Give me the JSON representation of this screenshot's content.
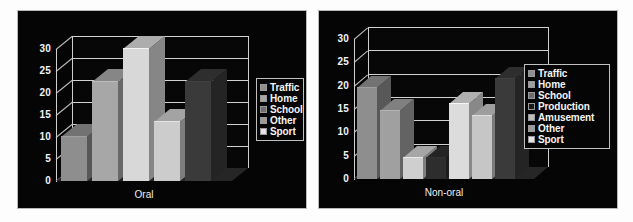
{
  "figure": {
    "background": "#ffffff",
    "panel_background": "#050505",
    "panel_border": "#b9b9b9"
  },
  "chart_data": [
    {
      "id": "oral",
      "type": "bar",
      "title": "",
      "xlabel": "Oral",
      "ylabel": "",
      "categories": [
        "Oral"
      ],
      "ylim": [
        0,
        30
      ],
      "yticks": [
        0,
        5,
        10,
        15,
        20,
        25,
        30
      ],
      "ytick_labels": [
        "0",
        "5",
        "10",
        "15",
        "20",
        "25",
        "30"
      ],
      "grid": true,
      "legend_position": "right",
      "three_d": true,
      "series": [
        {
          "name": "Traffic",
          "value": 10.0,
          "color": "#8e8e8e"
        },
        {
          "name": "Home",
          "value": 22.5,
          "color": "#a7a7a7"
        },
        {
          "name": "School",
          "value": 30.0,
          "color": "#d8d8d8"
        },
        {
          "name": "Other",
          "value": 13.5,
          "color": "#cccccc"
        },
        {
          "name": "Sport",
          "value": 22.5,
          "color": "#3a3a3a"
        }
      ],
      "legend": [
        {
          "label": "Traffic",
          "color": "#8e8e8e"
        },
        {
          "label": "Home",
          "color": "#a7a7a7"
        },
        {
          "label": "School",
          "color": "#6e6e6e"
        },
        {
          "label": "Other",
          "color": "#9b9b9b"
        },
        {
          "label": "Sport",
          "color": "#e3e3e3"
        }
      ]
    },
    {
      "id": "non-oral",
      "type": "bar",
      "title": "",
      "xlabel": "Non-oral",
      "ylabel": "",
      "categories": [
        "Non-oral"
      ],
      "ylim": [
        0,
        30
      ],
      "yticks": [
        0,
        5,
        10,
        15,
        20,
        25,
        30
      ],
      "ytick_labels": [
        "0",
        "5",
        "10",
        "15",
        "20",
        "25",
        "30"
      ],
      "grid": true,
      "legend_position": "right",
      "three_d": true,
      "series": [
        {
          "name": "Traffic",
          "value": 19.5,
          "color": "#8e8e8e"
        },
        {
          "name": "Home",
          "value": 14.5,
          "color": "#a0a0a0"
        },
        {
          "name": "School",
          "value": 4.5,
          "color": "#cfcfcf"
        },
        {
          "name": "Production",
          "value": 4.5,
          "color": "#2d2d2d"
        },
        {
          "name": "Amusement",
          "value": 16.0,
          "color": "#dcdcdc"
        },
        {
          "name": "Other",
          "value": 13.5,
          "color": "#c6c6c6"
        },
        {
          "name": "Sport",
          "value": 21.5,
          "color": "#3a3a3a"
        }
      ],
      "legend": [
        {
          "label": "Traffic",
          "color": "#8e8e8e"
        },
        {
          "label": "Home",
          "color": "#a0a0a0"
        },
        {
          "label": "School",
          "color": "#6e6e6e"
        },
        {
          "label": "Production",
          "color": "#1a1a1a"
        },
        {
          "label": "Amusement",
          "color": "#bdbdbd"
        },
        {
          "label": "Other",
          "color": "#9b9b9b"
        },
        {
          "label": "Sport",
          "color": "#e3e3e3"
        }
      ]
    }
  ]
}
